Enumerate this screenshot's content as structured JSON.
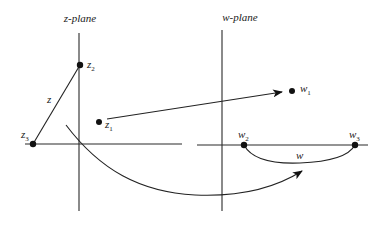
{
  "figure": {
    "z_plane": {
      "title": "z-plane",
      "points": [
        {
          "name": "z",
          "sub": "1",
          "x": 99,
          "y": 122
        },
        {
          "name": "z",
          "sub": "2",
          "x": 80,
          "y": 65
        },
        {
          "name": "z",
          "sub": "3",
          "x": 33,
          "y": 144
        }
      ],
      "segment_label": "z"
    },
    "w_plane": {
      "title": "w-plane",
      "points": [
        {
          "name": "w",
          "sub": "1",
          "x": 292,
          "y": 91
        },
        {
          "name": "w",
          "sub": "2",
          "x": 244,
          "y": 145
        },
        {
          "name": "w",
          "sub": "3",
          "x": 355,
          "y": 145
        }
      ],
      "arc_label": "w"
    },
    "colors": {
      "background": "#ffffff",
      "ink": "#1a1a1a"
    }
  }
}
